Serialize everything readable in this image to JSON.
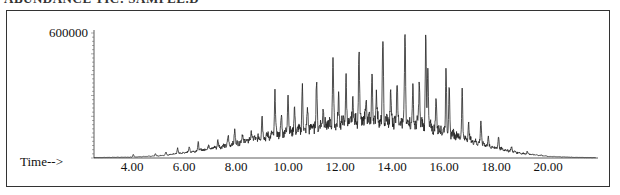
{
  "header": {
    "title_cut": "ABUNDANCE TIC: SAMPLE.D"
  },
  "chart_data": {
    "type": "line",
    "title": "",
    "xlabel": "Time-->",
    "ylabel": "",
    "xlim": [
      2.5,
      22.0
    ],
    "ylim": [
      0,
      615000
    ],
    "x_ticks": [
      "4.00",
      "6.00",
      "8.00",
      "10.00",
      "12.00",
      "14.00",
      "16.00",
      "18.00",
      "20.00"
    ],
    "x_tick_values": [
      4,
      6,
      8,
      10,
      12,
      14,
      16,
      18,
      20
    ],
    "y_ticks": [
      "600000"
    ],
    "y_tick_values": [
      600000
    ],
    "grid": false,
    "legend": null,
    "baseline_envelope": {
      "x": [
        2.5,
        4,
        5,
        6,
        7,
        8,
        9,
        10,
        11,
        12,
        13,
        14,
        15,
        16,
        17,
        18,
        19,
        20,
        21,
        22
      ],
      "y": [
        2000,
        4000,
        10000,
        25000,
        45000,
        70000,
        100000,
        125000,
        150000,
        170000,
        180000,
        180000,
        165000,
        130000,
        85000,
        48000,
        22000,
        8000,
        3000,
        1500
      ]
    },
    "peaks": [
      {
        "t": 4.05,
        "h": 18000
      },
      {
        "t": 4.9,
        "h": 22000
      },
      {
        "t": 5.3,
        "h": 28000
      },
      {
        "t": 5.75,
        "h": 48000
      },
      {
        "t": 6.2,
        "h": 55000
      },
      {
        "t": 6.55,
        "h": 75000
      },
      {
        "t": 6.95,
        "h": 70000
      },
      {
        "t": 7.3,
        "h": 85000
      },
      {
        "t": 7.7,
        "h": 105000
      },
      {
        "t": 7.95,
        "h": 140000
      },
      {
        "t": 8.25,
        "h": 120000
      },
      {
        "t": 8.6,
        "h": 130000
      },
      {
        "t": 9.0,
        "h": 205000
      },
      {
        "t": 9.5,
        "h": 316000
      },
      {
        "t": 9.75,
        "h": 200000
      },
      {
        "t": 10.0,
        "h": 326000
      },
      {
        "t": 10.25,
        "h": 235000
      },
      {
        "t": 10.55,
        "h": 336000
      },
      {
        "t": 10.75,
        "h": 230000
      },
      {
        "t": 11.1,
        "h": 370000
      },
      {
        "t": 11.35,
        "h": 255000
      },
      {
        "t": 11.73,
        "h": 494000
      },
      {
        "t": 11.95,
        "h": 290000
      },
      {
        "t": 12.23,
        "h": 384000
      },
      {
        "t": 12.5,
        "h": 295000
      },
      {
        "t": 12.73,
        "h": 528000
      },
      {
        "t": 13.0,
        "h": 300000
      },
      {
        "t": 13.23,
        "h": 408000
      },
      {
        "t": 13.4,
        "h": 330000
      },
      {
        "t": 13.65,
        "h": 580000
      },
      {
        "t": 13.95,
        "h": 300000
      },
      {
        "t": 14.2,
        "h": 390000
      },
      {
        "t": 14.5,
        "h": 605000
      },
      {
        "t": 14.8,
        "h": 330000
      },
      {
        "t": 15.05,
        "h": 370000
      },
      {
        "t": 15.3,
        "h": 595000
      },
      {
        "t": 15.38,
        "h": 430000
      },
      {
        "t": 15.7,
        "h": 290000
      },
      {
        "t": 16.08,
        "h": 430000
      },
      {
        "t": 16.2,
        "h": 320000
      },
      {
        "t": 16.7,
        "h": 322000
      },
      {
        "t": 16.95,
        "h": 170000
      },
      {
        "t": 17.42,
        "h": 182000
      },
      {
        "t": 17.7,
        "h": 95000
      },
      {
        "t": 18.1,
        "h": 106000
      },
      {
        "t": 18.6,
        "h": 55000
      },
      {
        "t": 19.2,
        "h": 30000
      },
      {
        "t": 19.75,
        "h": 14000
      }
    ]
  }
}
